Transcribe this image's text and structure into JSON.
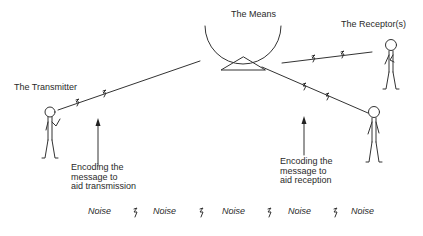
{
  "diagram": {
    "labels": {
      "means": "The Means",
      "transmitter": "The Transmitter",
      "receptors": "The Receptor(s)"
    },
    "annotations": {
      "encoding_transmission": [
        "Encoding the",
        "message to",
        "aid transmission"
      ],
      "encoding_reception": [
        "Encoding the",
        "message to",
        "aid reception"
      ]
    },
    "noise_row": {
      "word": "Noise",
      "items": [
        "Noise",
        "Noise",
        "Noise",
        "Noise",
        "Noise"
      ],
      "separator_icon": "lightning-squiggle"
    },
    "colors": {
      "line": "#333333",
      "text": "#2a2a2a",
      "background": "#ffffff"
    }
  }
}
